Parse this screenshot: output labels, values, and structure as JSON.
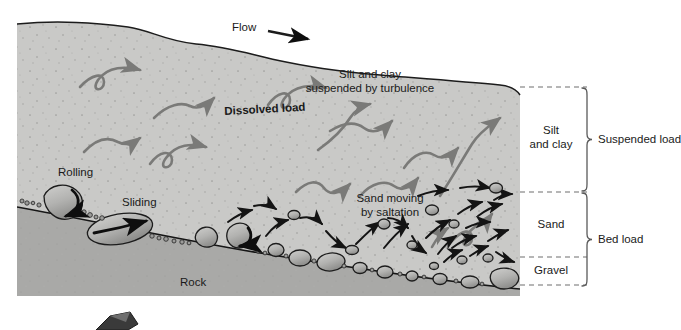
{
  "figure": {
    "type": "diagram",
    "palette": {
      "water_fill": "#c9c9c7",
      "rock_fill": "#a9a9a7",
      "clast_fill": "#b4b4b2",
      "outline": "#1c1c1c",
      "turbulence_arrow": "#7a7a78",
      "grain_arrow": "#141414",
      "text": "#1a1a1a",
      "dashed_rule": "#6e6e6e",
      "bracket": "#5a5a5a",
      "page_bg": "#ffffff"
    }
  },
  "annotations": {
    "flow": "Flow",
    "suspension": "Silt and clay\nsuspended by turbulence",
    "dissolved_load": "Dissolved load",
    "rolling": "Rolling",
    "sliding": "Sliding",
    "saltation": "Sand moving\nby saltation",
    "rock": "Rock"
  },
  "legend": {
    "bands": [
      {
        "id": "silt-and-clay",
        "label": "Silt\nand clay"
      },
      {
        "id": "sand",
        "label": "Sand"
      },
      {
        "id": "gravel",
        "label": "Gravel"
      }
    ],
    "groups": [
      {
        "id": "suspended-load",
        "label": "Suspended load"
      },
      {
        "id": "bed-load",
        "label": "Bed load"
      }
    ]
  },
  "geometry": {
    "frame": {
      "x": 17,
      "y": 19,
      "width": 503,
      "height": 277
    },
    "legend_column": {
      "x": 520,
      "width": 67
    },
    "dashed_rules_y": [
      87,
      192,
      257,
      285
    ],
    "band_rows": [
      {
        "id": "silt-and-clay",
        "top": 87,
        "bottom": 192
      },
      {
        "id": "sand",
        "top": 192,
        "bottom": 257
      },
      {
        "id": "gravel",
        "top": 257,
        "bottom": 285
      }
    ],
    "group_rows": [
      {
        "id": "suspended-load",
        "top": 87,
        "bottom": 192
      },
      {
        "id": "bed-load",
        "top": 192,
        "bottom": 285
      }
    ]
  }
}
